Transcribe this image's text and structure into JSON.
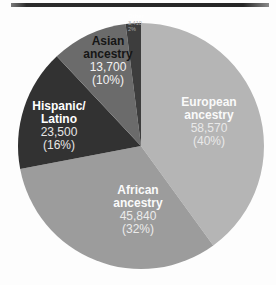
{
  "figure": {
    "background": "#fdfdfd",
    "top_rule_color": "#2c2c2c"
  },
  "chart_data": {
    "type": "pie",
    "title": "",
    "legend_position": "none",
    "start_angle_deg": 0,
    "direction": "clockwise",
    "slices": [
      {
        "id": "european",
        "label": "European ancestry",
        "label_lines": [
          "European",
          "ancestry"
        ],
        "value": 58570,
        "value_text": "58,570",
        "percent": 40,
        "percent_text": "(40%)",
        "color": "#b5b5b5",
        "title_color": "#fafafa",
        "text_color": "#e9e9e9"
      },
      {
        "id": "african",
        "label": "African ancestry",
        "label_lines": [
          "African",
          "ancestry"
        ],
        "value": 45840,
        "value_text": "45,840",
        "percent": 32,
        "percent_text": "(32%)",
        "color": "#9c9c9c",
        "title_color": "#fafafa",
        "text_color": "#ebebeb"
      },
      {
        "id": "hispanic-latino",
        "label": "Hispanic/ Latino",
        "label_lines": [
          "Hispanic/",
          "Latino"
        ],
        "value": 23500,
        "value_text": "23,500",
        "percent": 16,
        "percent_text": "(16%)",
        "color": "#323232",
        "title_color": "#ffffff",
        "text_color": "#e6e6e6"
      },
      {
        "id": "asian",
        "label": "Asian ancestry",
        "label_lines": [
          "Asian",
          "ancestry"
        ],
        "value": 13700,
        "value_text": "13,700",
        "percent": 10,
        "percent_text": "(10%)",
        "color": "#6b6b6b",
        "title_color": "#161616",
        "text_color": "#f2f2f2"
      },
      {
        "id": "other",
        "label": "Other",
        "label_lines": [
          "Other"
        ],
        "value": 3410,
        "value_text": "3,410",
        "percent": 2,
        "percent_text": "2%",
        "color": "#3d3d3d",
        "title_color": "#ffffff",
        "text_color": "#a9a9a9"
      }
    ]
  }
}
